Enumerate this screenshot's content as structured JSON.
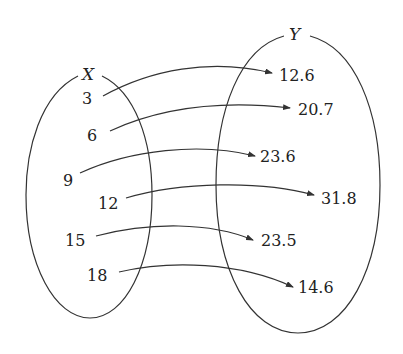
{
  "diagram": {
    "type": "mapping",
    "sets": {
      "domain": {
        "name": "X",
        "elements": [
          "3",
          "6",
          "9",
          "12",
          "15",
          "18"
        ]
      },
      "codomain": {
        "name": "Y",
        "elements": [
          "12.6",
          "20.7",
          "23.6",
          "31.8",
          "23.5",
          "14.6"
        ]
      }
    },
    "mappings": [
      {
        "from": "3",
        "to": "12.6"
      },
      {
        "from": "6",
        "to": "20.7"
      },
      {
        "from": "9",
        "to": "23.6"
      },
      {
        "from": "12",
        "to": "31.8"
      },
      {
        "from": "15",
        "to": "23.5"
      },
      {
        "from": "18",
        "to": "14.6"
      }
    ],
    "colors": {
      "stroke": "#333333",
      "text": "#222222",
      "background": "#ffffff"
    }
  }
}
